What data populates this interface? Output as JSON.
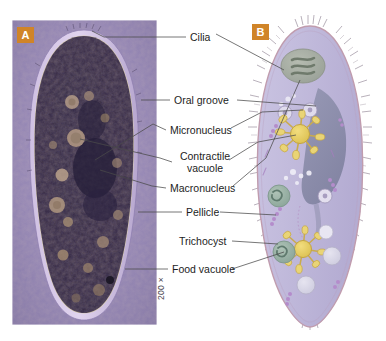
{
  "figure": {
    "background_color": "#ffffff",
    "accent_color": "#d08428",
    "label_color": "#1d1d1d",
    "leader_color": "#4a4a4a"
  },
  "panels": [
    {
      "id": "A",
      "badge_label": "A",
      "type": "light-micrograph",
      "caption_magnification": "200 ×",
      "frame": {
        "x": 12,
        "y": 20,
        "width": 145,
        "height": 305
      },
      "background_color": "#9b8ab9",
      "cell_color": "#3d3352",
      "pellicle_color": "#cfc2e0"
    },
    {
      "id": "B",
      "badge_label": "B",
      "type": "illustrated-diagram",
      "body_color": "#c3bcdd",
      "pellicle_color": "#cfa6b6",
      "macronucleus_color": "#a8b0a4",
      "contractile_vacuole_color": "#e8cf62",
      "food_vacuole_color": "#9bb3a8",
      "gullet_color": "#8a8ca9",
      "trichocyst_color": "#a98cc0"
    }
  ],
  "labels": [
    {
      "id": "cilia",
      "text": "Cilia",
      "x": 190,
      "y": 31,
      "align": "left"
    },
    {
      "id": "oral-groove",
      "text": "Oral groove",
      "x": 174,
      "y": 94,
      "align": "left"
    },
    {
      "id": "micronucleus",
      "text": "Micronucleus",
      "x": 170,
      "y": 124,
      "align": "left"
    },
    {
      "id": "contractile-vacuole",
      "text": "Contractile\nvacuole",
      "x": 176,
      "y": 152,
      "align": "center"
    },
    {
      "id": "macronucleus",
      "text": "Macronucleus",
      "x": 170,
      "y": 182,
      "align": "left"
    },
    {
      "id": "pellicle",
      "text": "Pellicle",
      "x": 186,
      "y": 206,
      "align": "left"
    },
    {
      "id": "trichocyst",
      "text": "Trichocyst",
      "x": 179,
      "y": 235,
      "align": "left"
    },
    {
      "id": "food-vacuole",
      "text": "Food vacuole",
      "x": 172,
      "y": 263,
      "align": "left"
    }
  ],
  "label_text": {
    "cilia": "Cilia",
    "oral_groove": "Oral groove",
    "micronucleus": "Micronucleus",
    "contractile_vacuole_line1": "Contractile",
    "contractile_vacuole_line2": "vacuole",
    "macronucleus": "Macronucleus",
    "pellicle": "Pellicle",
    "trichocyst": "Trichocyst",
    "food_vacuole": "Food vacuole",
    "magnification": "200 ×",
    "badge_a": "A",
    "badge_b": "B"
  }
}
